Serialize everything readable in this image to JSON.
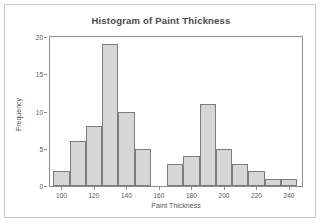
{
  "chart_data": {
    "type": "bar",
    "title": "Histogram of Paint Thickness",
    "xlabel": "Paint Thickness",
    "ylabel": "Frequency",
    "xlim": [
      93,
      248
    ],
    "ylim": [
      0,
      20
    ],
    "grid": false,
    "legend": null,
    "bin_width": 10,
    "bin_starts": [
      95,
      105,
      115,
      125,
      135,
      145,
      165,
      175,
      185,
      195,
      205,
      215,
      225,
      235
    ],
    "categories": [
      "95-105",
      "105-115",
      "115-125",
      "125-135",
      "135-145",
      "145-155",
      "165-175",
      "175-185",
      "185-195",
      "195-205",
      "205-215",
      "215-225",
      "225-235",
      "235-245"
    ],
    "values": [
      2,
      6,
      8,
      19,
      10,
      5,
      3,
      4,
      11,
      5,
      3,
      2,
      1,
      1
    ],
    "bars": [
      {
        "start": 95,
        "end": 105,
        "value": 2
      },
      {
        "start": 105,
        "end": 115,
        "value": 6
      },
      {
        "start": 115,
        "end": 125,
        "value": 8
      },
      {
        "start": 125,
        "end": 135,
        "value": 19
      },
      {
        "start": 135,
        "end": 145,
        "value": 10
      },
      {
        "start": 145,
        "end": 155,
        "value": 5
      },
      {
        "start": 165,
        "end": 175,
        "value": 3
      },
      {
        "start": 175,
        "end": 185,
        "value": 4
      },
      {
        "start": 185,
        "end": 195,
        "value": 11
      },
      {
        "start": 195,
        "end": 205,
        "value": 5
      },
      {
        "start": 205,
        "end": 215,
        "value": 3
      },
      {
        "start": 215,
        "end": 225,
        "value": 2
      },
      {
        "start": 225,
        "end": 235,
        "value": 1
      },
      {
        "start": 235,
        "end": 245,
        "value": 1
      }
    ],
    "x_ticks": [
      100,
      120,
      140,
      160,
      180,
      200,
      220,
      240
    ],
    "x_tick_labels": [
      "100",
      "120",
      "140",
      "160",
      "180",
      "200",
      "220",
      "240"
    ],
    "y_ticks": [
      0,
      5,
      10,
      15,
      20
    ],
    "y_tick_labels": [
      "0",
      "5",
      "10",
      "15",
      "20"
    ],
    "colors": {
      "bar_fill": "#d6d6d6",
      "bar_stroke": "#7d7d7d",
      "axis": "#8d8d8d",
      "title_text": "#4a4a4a",
      "label_text": "#585858",
      "frame": "#c9c9c9",
      "background": "#ffffff"
    }
  }
}
